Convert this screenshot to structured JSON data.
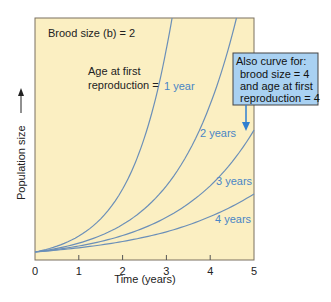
{
  "chart_data": {
    "type": "line",
    "title": "",
    "xlabel": "Time (years)",
    "ylabel": "Population size",
    "xlim": [
      0,
      5
    ],
    "ylim": [
      1,
      30
    ],
    "xticks": [
      0,
      1,
      2,
      3,
      4,
      5
    ],
    "yticks": [],
    "grid": false,
    "background_color": "#fbefc2",
    "curve_color": "#6b8fb8",
    "label_color": "#4a86c5",
    "annotations": {
      "brood_size": "Brood size (b) = 2",
      "age_label_line1": "Age at first",
      "age_label_line2": "reproduction ="
    },
    "series": [
      {
        "name": "1 year",
        "x": [
          0,
          1,
          2,
          2.5,
          3,
          3.13
        ],
        "y": [
          1,
          2.97,
          8.8,
          15.2,
          26.2,
          30
        ]
      },
      {
        "name": "2 years",
        "x": [
          0,
          1,
          2,
          3,
          4,
          4.6
        ],
        "y": [
          1,
          2.1,
          4.4,
          9.2,
          19.3,
          30
        ]
      },
      {
        "name": "3 years",
        "x": [
          0,
          1,
          2,
          3,
          4,
          5
        ],
        "y": [
          1,
          1.74,
          3.04,
          5.3,
          9.2,
          16.1
        ]
      },
      {
        "name": "4 years",
        "x": [
          0,
          1,
          2,
          3,
          4,
          5
        ],
        "y": [
          1,
          1.52,
          2.3,
          3.5,
          5.4,
          8.2
        ]
      }
    ],
    "callout": {
      "lines": [
        "Also curve for:",
        "brood size = 4",
        "and age at first",
        "reproduction = 4"
      ],
      "points_to": "3 years",
      "fill": "#a9d1f2",
      "arrow_color": "#2f7fd0"
    }
  }
}
